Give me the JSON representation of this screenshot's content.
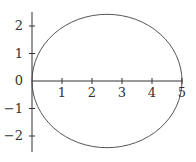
{
  "chart_data": {
    "type": "line",
    "title": "",
    "xlabel": "",
    "ylabel": "",
    "shape": {
      "kind": "circle",
      "center": [
        2.5,
        0
      ],
      "radius": 2.5
    },
    "x_ticks": [
      1,
      2,
      3,
      4,
      5
    ],
    "y_ticks": [
      2,
      1,
      0,
      -1,
      -2
    ],
    "x_tick_labels": [
      "1",
      "2",
      "3",
      "4",
      "5"
    ],
    "y_tick_labels": [
      "2",
      "1",
      "0",
      "−1",
      "−2"
    ],
    "xlim": [
      0,
      5
    ],
    "ylim": [
      -2.5,
      2.5
    ],
    "grid": false,
    "legend": null,
    "line_color": "#555555",
    "axis_color": "#333333"
  }
}
